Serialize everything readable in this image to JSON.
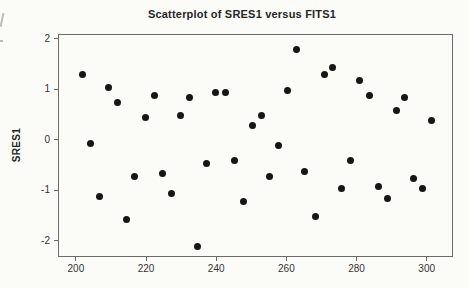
{
  "page": {
    "background": "#fbfbf8"
  },
  "chart_data": {
    "type": "scatter",
    "title": "Scatterplot of SRES1 versus FITS1",
    "xlabel": "",
    "ylabel": "SRES1",
    "xlim": [
      194.9,
      307.5
    ],
    "ylim": [
      -2.32,
      2.09
    ],
    "x_ticks": [
      200,
      220,
      240,
      260,
      280,
      300
    ],
    "y_ticks": [
      2,
      1,
      0,
      -1,
      -2
    ],
    "grid": false,
    "legend": false,
    "marker": "filled-circle",
    "point_color": "#161616",
    "frame_color": "#6b6b6b",
    "points": [
      [
        201.5,
        1.3
      ],
      [
        204,
        -0.05
      ],
      [
        206.5,
        -1.1
      ],
      [
        209,
        1.05
      ],
      [
        211.5,
        0.75
      ],
      [
        214,
        -1.55
      ],
      [
        216.5,
        -0.7
      ],
      [
        219.5,
        0.45
      ],
      [
        222,
        0.9
      ],
      [
        224.5,
        -0.65
      ],
      [
        227,
        -1.05
      ],
      [
        229.5,
        0.5
      ],
      [
        232,
        0.85
      ],
      [
        234.5,
        -2.1
      ],
      [
        237,
        -0.45
      ],
      [
        239.5,
        0.95
      ],
      [
        242.5,
        0.95
      ],
      [
        245,
        -0.4
      ],
      [
        247.5,
        -1.2
      ],
      [
        250,
        0.3
      ],
      [
        252.5,
        0.5
      ],
      [
        255,
        -0.7
      ],
      [
        257.5,
        -0.1
      ],
      [
        260,
        1.0
      ],
      [
        262.5,
        1.8
      ],
      [
        265,
        -0.6
      ],
      [
        268,
        -1.5
      ],
      [
        270.5,
        1.3
      ],
      [
        273,
        1.45
      ],
      [
        275.5,
        -0.95
      ],
      [
        278,
        -0.4
      ],
      [
        280.5,
        1.2
      ],
      [
        283.5,
        0.9
      ],
      [
        286,
        -0.9
      ],
      [
        288.5,
        -1.15
      ],
      [
        291,
        0.6
      ],
      [
        293.5,
        0.85
      ],
      [
        296,
        -0.75
      ],
      [
        298.5,
        -0.95
      ],
      [
        301,
        0.4
      ]
    ]
  }
}
